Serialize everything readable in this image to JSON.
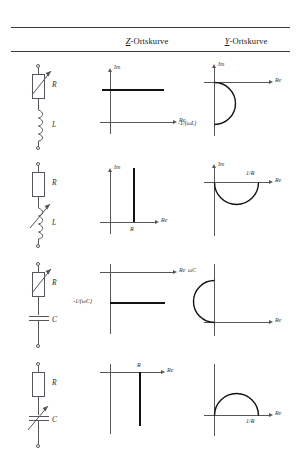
{
  "header": {
    "col_circuit": "",
    "col_z": {
      "symbol": "Z",
      "rest": "-Ortskurve"
    },
    "col_y": {
      "symbol": "Y",
      "rest": "-Ortskurve"
    }
  },
  "axis_labels": {
    "im": "Im",
    "re": "Re"
  },
  "rows": [
    {
      "id": "row-r-variable-l",
      "circuit": {
        "elements": [
          {
            "type": "resistor-variable",
            "label": "R"
          },
          {
            "type": "inductor",
            "label": "L"
          }
        ]
      },
      "z_plot": {
        "locus_type": "horizontal-line",
        "description": "Horizontal line above the real axis at constant Im = ωL, R varies",
        "labels": []
      },
      "y_plot": {
        "locus_type": "semicircle-lower-right",
        "description": "Semicircle in the fourth quadrant below the real axis",
        "labels": [
          {
            "text": "-1/(ωL)",
            "anchor": "imaginary-axis-bottom"
          }
        ]
      }
    },
    {
      "id": "row-r-l-variable",
      "circuit": {
        "elements": [
          {
            "type": "resistor",
            "label": "R"
          },
          {
            "type": "inductor-variable",
            "label": "L"
          }
        ]
      },
      "z_plot": {
        "locus_type": "vertical-line",
        "description": "Vertical line rising from the real axis at Re = R, ωL varies",
        "labels": [
          {
            "text": "R",
            "anchor": "real-axis-foot"
          }
        ]
      },
      "y_plot": {
        "locus_type": "semicircle-lower",
        "description": "Semicircle below the real axis ending at 1/R",
        "labels": [
          {
            "text": "1/R",
            "anchor": "real-axis-right"
          }
        ]
      }
    },
    {
      "id": "row-r-variable-c",
      "circuit": {
        "elements": [
          {
            "type": "resistor-variable",
            "label": "R"
          },
          {
            "type": "capacitor",
            "label": "C"
          }
        ]
      },
      "z_plot": {
        "locus_type": "horizontal-line",
        "description": "Horizontal line below the real axis at Im = -1/(ωC), R varies",
        "labels": [
          {
            "text": "-1/(ωC)",
            "anchor": "imaginary-axis-left"
          }
        ]
      },
      "y_plot": {
        "locus_type": "semicircle-upper-right",
        "description": "Semicircle in the first quadrant above the real axis",
        "labels": [
          {
            "text": "ωC",
            "anchor": "imaginary-axis-top"
          }
        ]
      }
    },
    {
      "id": "row-r-c-variable",
      "circuit": {
        "elements": [
          {
            "type": "resistor",
            "label": "R"
          },
          {
            "type": "capacitor-variable",
            "label": "C"
          }
        ]
      },
      "z_plot": {
        "locus_type": "vertical-line-down",
        "description": "Vertical line descending from the real axis at Re = R, 1/(ωC) varies",
        "labels": [
          {
            "text": "R",
            "anchor": "real-axis-head"
          }
        ]
      },
      "y_plot": {
        "locus_type": "semicircle-upper",
        "description": "Semicircle above the real axis ending at 1/R",
        "labels": [
          {
            "text": "1/R",
            "anchor": "real-axis-right"
          }
        ]
      }
    }
  ]
}
